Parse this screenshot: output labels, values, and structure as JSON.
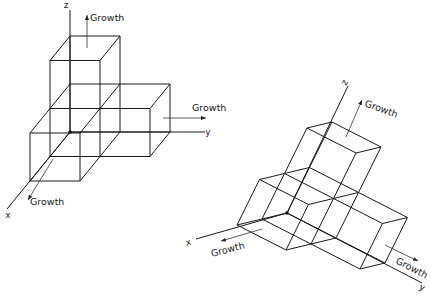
{
  "diagram": {
    "stroke_color": "#1a1a1a",
    "cubes": [
      [
        0,
        0,
        0
      ],
      [
        1,
        0,
        0
      ],
      [
        0,
        1,
        0
      ],
      [
        0,
        0,
        1
      ]
    ],
    "figures": [
      {
        "id": "left",
        "origin": [
          70,
          132
        ],
        "vec_x": [
          -20,
          24.5
        ],
        "vec_y": [
          50,
          0
        ],
        "vec_z": [
          0,
          -48
        ],
        "axes": {
          "x": {
            "label": "x",
            "end": [
              7,
              209
            ],
            "label_pos": [
              8,
              218
            ],
            "rotate": 0
          },
          "y": {
            "label": "y",
            "end": [
              205,
              132
            ],
            "label_pos": [
              208,
              135
            ],
            "rotate": 0
          },
          "z": {
            "label": "z",
            "end": [
              70,
              10
            ],
            "label_pos": [
              66,
              8
            ],
            "rotate": 0
          }
        },
        "growth": [
          {
            "label": "Growth",
            "arrow_from": [
              87,
              48
            ],
            "arrow_to": [
              87,
              15
            ],
            "text_pos": [
              90,
              21
            ],
            "rotate": 0
          },
          {
            "label": "Growth",
            "arrow_from": [
              163,
              118
            ],
            "arrow_to": [
              206,
              118
            ],
            "text_pos": [
              192,
              111
            ],
            "rotate": 0
          },
          {
            "label": "Growth",
            "arrow_from": [
              53,
              159
            ],
            "arrow_to": [
              28,
              200
            ],
            "text_pos": [
              30,
              205
            ],
            "rotate": 0
          }
        ]
      },
      {
        "id": "right",
        "origin": [
          287,
          213
        ],
        "vec_x": [
          -25,
          6
        ],
        "vec_y": [
          49,
          25
        ],
        "vec_z": [
          22.5,
          -45.5
        ],
        "axes": {
          "x": {
            "label": "x",
            "end": [
              196,
              239
            ],
            "label_pos": [
              189,
              245
            ],
            "rotate": -15
          },
          "y": {
            "label": "y",
            "end": [
              422,
              283
            ],
            "label_pos": [
              421,
              290
            ],
            "rotate": 27
          },
          "z": {
            "label": "z",
            "end": [
              348,
              86
            ],
            "label_pos": [
              347,
              84
            ],
            "rotate": -62
          }
        },
        "growth": [
          {
            "label": "Growth",
            "arrow_from": [
              346,
              137
            ],
            "arrow_to": [
              362,
              100
            ],
            "text_pos": [
              364,
              106
            ],
            "rotate": 20
          },
          {
            "label": "Growth",
            "arrow_from": [
              385,
              245
            ],
            "arrow_to": [
              418,
              261
            ],
            "text_pos": [
              395,
              263
            ],
            "rotate": 27
          },
          {
            "label": "Growth",
            "arrow_from": [
              262,
              229
            ],
            "arrow_to": [
              221,
              241
            ],
            "text_pos": [
              212,
              257
            ],
            "rotate": -15
          }
        ]
      }
    ]
  }
}
